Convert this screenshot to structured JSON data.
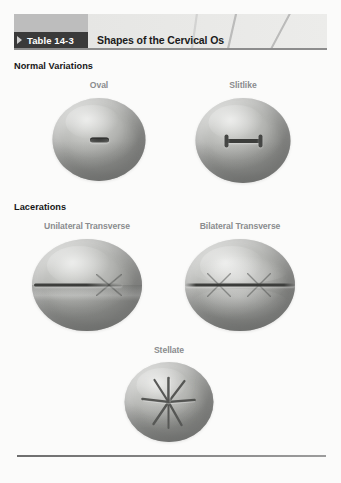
{
  "page": {
    "background_color": "#fbfbfa"
  },
  "header": {
    "tag_label": "Table 14-3",
    "title": "Shapes of the Cervical Os",
    "tag_background": "#3a3a3a",
    "tag_text_color": "#ffffff",
    "title_text_color": "#1b1b1b"
  },
  "sections": [
    {
      "heading": "Normal Variations"
    },
    {
      "heading": "Lacerations"
    }
  ],
  "figures": [
    {
      "label": "Oval",
      "os_type": "small-oval-slit"
    },
    {
      "label": "Slitlike",
      "os_type": "horizontal-dumbbell-slit"
    },
    {
      "label": "Unilateral Transverse",
      "os_type": "single-transverse-cleft"
    },
    {
      "label": "Bilateral Transverse",
      "os_type": "double-transverse-cleft"
    },
    {
      "label": "Stellate",
      "os_type": "star-shaped-clefts"
    }
  ],
  "colors": {
    "label_gray": "#8a8c8e",
    "heading_black": "#171717",
    "specimen_body": "#c6c7c4",
    "os_dark": "#3c3d3b",
    "rule": "#7c7c7c"
  }
}
